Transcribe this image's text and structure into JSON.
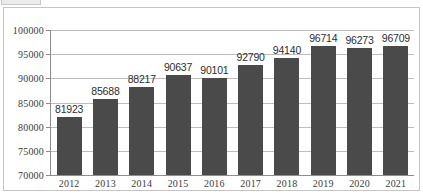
{
  "window": {
    "top_bar_name": "toolbar-fragment"
  },
  "chart_data": {
    "type": "bar",
    "title": "",
    "subtitle": "",
    "xlabel": "",
    "ylabel": "",
    "categories": [
      "2012",
      "2013",
      "2014",
      "2015",
      "2016",
      "2017",
      "2018",
      "2019",
      "2020",
      "2021"
    ],
    "values": [
      81923,
      85688,
      88217,
      90637,
      90101,
      92790,
      94140,
      96714,
      96273,
      96709
    ],
    "data_labels": [
      "81923",
      "85688",
      "88217",
      "90637",
      "90101",
      "92790",
      "94140",
      "96714",
      "96273",
      "96709"
    ],
    "ylim": [
      70000,
      100000
    ],
    "ytick_values": [
      70000,
      75000,
      80000,
      85000,
      90000,
      95000,
      100000
    ],
    "ytick_labels": [
      "70000",
      "75000",
      "80000",
      "85000",
      "90000",
      "95000",
      "100000"
    ],
    "grid": true,
    "grid_axis": "y",
    "legend": false,
    "legend_position": "none",
    "series": [
      {
        "name": "",
        "values": [
          81923,
          85688,
          88217,
          90637,
          90101,
          92790,
          94140,
          96714,
          96273,
          96709
        ]
      }
    ],
    "colors": {
      "bar": "#4a4a4a",
      "gridline": "#bdbdbd",
      "axis": "#8d8d8d",
      "frame_border": "#c6c3c3",
      "label_text": "#2e2e2e",
      "tick_text": "#3b3b3b",
      "background": "#ffffff"
    }
  }
}
